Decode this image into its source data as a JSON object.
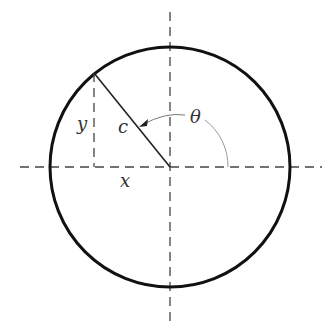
{
  "diagram": {
    "type": "unit-circle-polar",
    "labels": {
      "x": "x",
      "y": "y",
      "c": "c",
      "theta": "θ"
    },
    "colors": {
      "circle": "#111111",
      "axes": "#444444",
      "radius": "#222222",
      "arc": "#888888",
      "text": "#333333"
    },
    "geometry": {
      "center": [
        170,
        167
      ],
      "radius": 120,
      "point": [
        94,
        73
      ]
    }
  }
}
